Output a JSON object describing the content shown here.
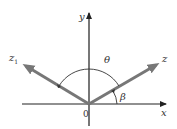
{
  "diagram": {
    "title": "",
    "axes": {
      "x_label": "x",
      "y_label": "y",
      "origin_label": "0"
    },
    "vectors": [
      {
        "name": "z",
        "label": "z",
        "subscript": ""
      },
      {
        "name": "z1",
        "label": "z",
        "subscript": "1"
      }
    ],
    "angles": {
      "theta_label": "θ",
      "beta_label": "β"
    },
    "colors": {
      "axis": "#222222",
      "vector": "#777777",
      "arc": "#333333",
      "text": "#333333"
    }
  }
}
